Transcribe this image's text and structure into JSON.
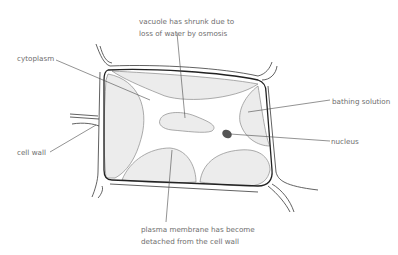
{
  "diagram": {
    "labels": {
      "vacuole_line1": "vacuole has shrunk due to",
      "vacuole_line2": "loss of water by osmosis",
      "cytoplasm": "cytoplasm",
      "bathing_solution": "bathing solution",
      "nucleus": "nucleus",
      "cell_wall": "cell wall",
      "membrane_line1": "plasma membrane has become",
      "membrane_line2": "detached from the cell wall"
    },
    "colors": {
      "label_text": "#6d6d6d",
      "wall_stroke": "#222222",
      "region_fill": "#ececec",
      "nucleus_fill": "#555555"
    }
  }
}
